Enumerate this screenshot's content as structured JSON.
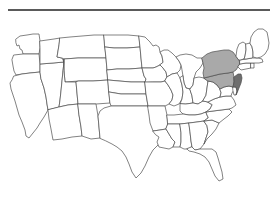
{
  "page": {
    "background_color": "#ffffff",
    "divider_color": "#5a5a5a",
    "bottom_caption": ""
  },
  "map": {
    "title": "United States map with Mid-Atlantic states highlighted",
    "projection_note": "contiguous united states outline",
    "border_color": "#4d4d4d",
    "default_fill": "#ffffff",
    "highlight_light_fill": "#a9a9a9",
    "highlight_dark_fill": "#6e6e6e",
    "highlighted_states": [
      {
        "code": "NY",
        "name": "New York",
        "shade": "light"
      },
      {
        "code": "PA",
        "name": "Pennsylvania",
        "shade": "light"
      },
      {
        "code": "NJ",
        "name": "New Jersey",
        "shade": "dark"
      }
    ],
    "states": [
      "WA",
      "OR",
      "CA",
      "NV",
      "ID",
      "MT",
      "WY",
      "UT",
      "AZ",
      "CO",
      "NM",
      "ND",
      "SD",
      "NE",
      "KS",
      "OK",
      "TX",
      "MN",
      "IA",
      "MO",
      "AR",
      "LA",
      "WI",
      "IL",
      "MI",
      "IN",
      "OH",
      "KY",
      "TN",
      "MS",
      "AL",
      "GA",
      "FL",
      "SC",
      "NC",
      "VA",
      "WV",
      "MD",
      "DE",
      "NJ",
      "PA",
      "NY",
      "CT",
      "RI",
      "MA",
      "VT",
      "NH",
      "ME"
    ]
  }
}
